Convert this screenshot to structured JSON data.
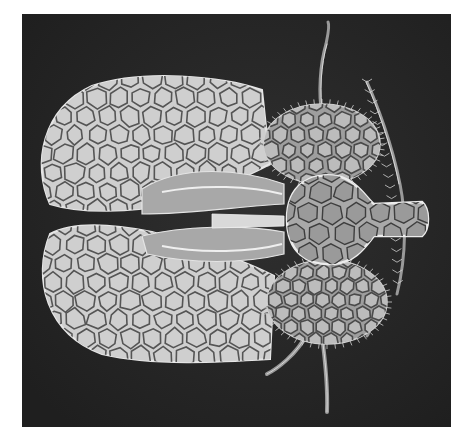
{
  "image": {
    "subject": "lace bug (Tingidae) scanning electron micrograph",
    "description": "Dorsal view of a lace bug with reticulated hemelytra, expanded paranota, hood-like pronotum, antennae and legs on a dark background",
    "palette": {
      "background": "#2b2b2b",
      "frame_margin": "#ffffff",
      "cell_fill": "#bcbcbc",
      "cell_vein": "#4a4a4a",
      "highlight": "#e4e4e4"
    }
  }
}
